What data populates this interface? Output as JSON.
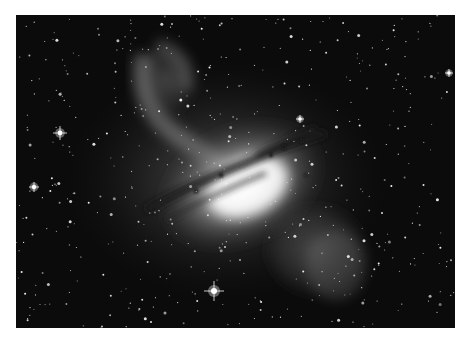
{
  "image": {
    "subject": "galaxy-with-dust-lane",
    "description": "Grayscale astronomical photograph of an elliptical galaxy with a dark dust lane, jet lobes, and dense star field",
    "colors": {
      "background": "#0b0b0b",
      "glow": "#ffffff",
      "dust": "#1a1a1a"
    },
    "bright_stars": [
      {
        "x": 44,
        "y": 118,
        "r": 2.4,
        "spike": 7
      },
      {
        "x": 198,
        "y": 276,
        "r": 3,
        "spike": 10
      },
      {
        "x": 18,
        "y": 172,
        "r": 2.2,
        "spike": 5
      },
      {
        "x": 284,
        "y": 104,
        "r": 1.8,
        "spike": 4
      },
      {
        "x": 433,
        "y": 58,
        "r": 1.8,
        "spike": 4
      }
    ]
  }
}
